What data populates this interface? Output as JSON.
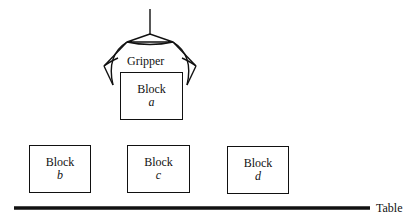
{
  "diagram": {
    "gripper_label": "Gripper",
    "table_label": "Table",
    "blocks": [
      {
        "name": "Block",
        "letter": "a",
        "held_by": "Gripper"
      },
      {
        "name": "Block",
        "letter": "b"
      },
      {
        "name": "Block",
        "letter": "c"
      },
      {
        "name": "Block",
        "letter": "d"
      }
    ],
    "colors": {
      "stroke": "#111111",
      "background": "#ffffff"
    }
  }
}
